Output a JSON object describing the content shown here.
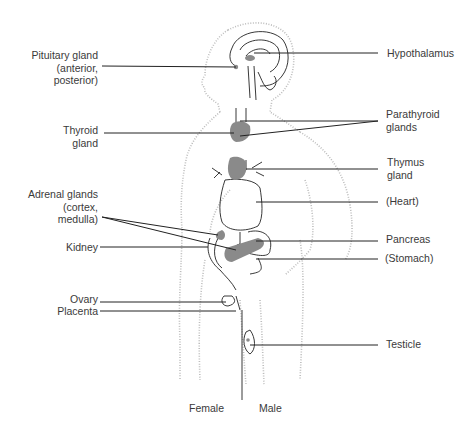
{
  "diagram": {
    "labels_left": [
      {
        "id": "pituitary",
        "lines": [
          "Pituitary gland",
          "(anterior,",
          "posterior)"
        ]
      },
      {
        "id": "thyroid",
        "lines": [
          "Thyroid",
          "gland"
        ]
      },
      {
        "id": "adrenal",
        "lines": [
          "Adrenal glands",
          "(cortex,",
          "medulla)"
        ]
      },
      {
        "id": "kidney",
        "lines": [
          "Kidney"
        ]
      },
      {
        "id": "ovary",
        "lines": [
          "Ovary"
        ]
      },
      {
        "id": "placenta",
        "lines": [
          "Placenta"
        ]
      }
    ],
    "labels_right": [
      {
        "id": "hypothalamus",
        "lines": [
          "Hypothalamus"
        ]
      },
      {
        "id": "parathyroid",
        "lines": [
          "Parathyroid",
          "glands"
        ]
      },
      {
        "id": "thymus",
        "lines": [
          "Thymus",
          "gland"
        ]
      },
      {
        "id": "heart",
        "lines": [
          "(Heart)"
        ]
      },
      {
        "id": "pancreas",
        "lines": [
          "Pancreas"
        ]
      },
      {
        "id": "stomach",
        "lines": [
          "(Stomach)"
        ]
      },
      {
        "id": "testicle",
        "lines": [
          "Testicle"
        ]
      }
    ],
    "bottom_labels": {
      "female": "Female",
      "male": "Male"
    },
    "colors": {
      "gland_fill": "#8a8a8a",
      "line": "#222222",
      "outline_dots": "#b5b5b5"
    }
  }
}
